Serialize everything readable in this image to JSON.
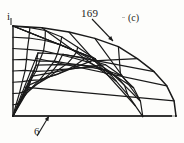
{
  "figure": {
    "caption": "(c)",
    "axis_label": "i",
    "node_label_top": "169",
    "node_label_bottom": "6",
    "ink_color": "#1a1a1a",
    "paper_color": "#fdfdfb"
  },
  "chart_data": {
    "type": "diagram",
    "title": "",
    "subtitle": "(c)",
    "annotations": [
      {
        "text": "169",
        "role": "node-number",
        "text_x": 92,
        "text_y": 14,
        "points_to_x": 113,
        "points_to_y": 41
      },
      {
        "text": "6",
        "role": "node-number",
        "text_x": 37,
        "text_y": 131,
        "points_to_x": 49,
        "points_to_y": 116
      },
      {
        "text": "i",
        "role": "axis-tick",
        "text_x": 9,
        "text_y": 16
      },
      {
        "text": "(c)",
        "role": "subfigure-caption",
        "text_x": 133,
        "text_y": 19
      }
    ],
    "mesh": {
      "interior_columns": 8,
      "interior_rows": 8,
      "arc_band_cells": 9,
      "origin_x": 13,
      "origin_y": 116,
      "top_edge_y": 26,
      "left_edge_x": 13,
      "right_edge_x": 176,
      "arc_center_x": 13,
      "arc_center_y": 116,
      "arc_radius_x": 163,
      "arc_radius_y": 90
    },
    "xlabel": "",
    "ylabel": "",
    "grid": true,
    "legend": "none"
  }
}
